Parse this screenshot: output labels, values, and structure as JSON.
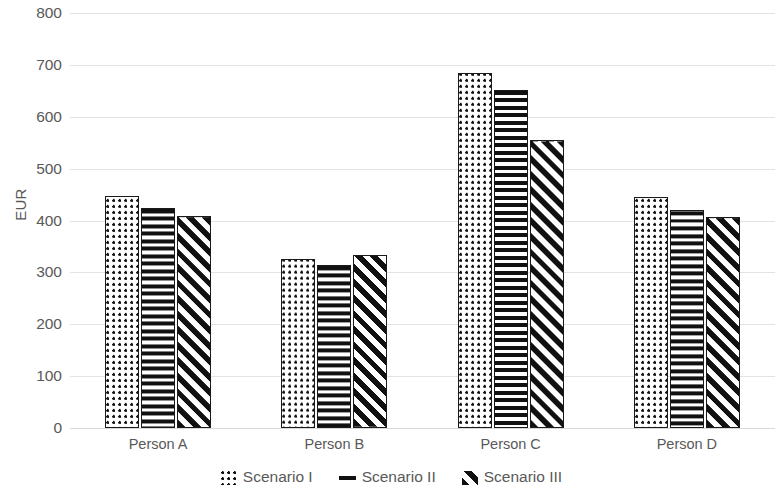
{
  "chart_data": {
    "type": "bar",
    "title": "",
    "xlabel": "",
    "ylabel": "EUR",
    "ylim": [
      0,
      800
    ],
    "yticks": [
      0,
      100,
      200,
      300,
      400,
      500,
      600,
      700,
      800
    ],
    "ytick_labels": [
      "0",
      "100",
      "200",
      "300",
      "400",
      "500",
      "600",
      "700",
      "800"
    ],
    "grid": true,
    "legend_position": "bottom",
    "categories": [
      "Person A",
      "Person B",
      "Person C",
      "Person D"
    ],
    "series": [
      {
        "name": "Scenario I",
        "pattern": "dots",
        "values": [
          447,
          325,
          684,
          445
        ]
      },
      {
        "name": "Scenario II",
        "pattern": "horizontal-lines",
        "values": [
          425,
          315,
          651,
          421
        ]
      },
      {
        "name": "Scenario III",
        "pattern": "diagonal-lines",
        "values": [
          409,
          333,
          556,
          407
        ]
      }
    ],
    "colors": {
      "bar_outline": "#1a1a1a",
      "bar_fill": "#ffffff",
      "pattern": "#111111",
      "gridline": "#e2e3e5",
      "text": "#595959",
      "background": "#ffffff"
    }
  },
  "legend": {
    "items": [
      {
        "label": "Scenario I",
        "icon": "dots-swatch-icon"
      },
      {
        "label": "Scenario II",
        "icon": "horizontal-lines-swatch-icon"
      },
      {
        "label": "Scenario III",
        "icon": "diagonal-lines-swatch-icon"
      }
    ]
  }
}
